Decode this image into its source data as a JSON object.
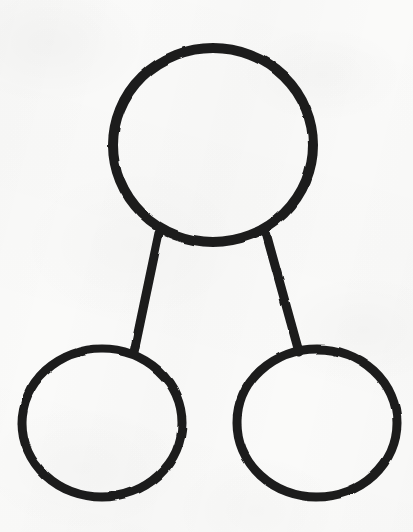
{
  "document": {
    "kind": "hand-drawn-scanned-diagram",
    "title": "Three-circle connected node diagram",
    "width": 413,
    "height": 532,
    "background_color": "#fafaf9",
    "ink_color": "#1c1c1c",
    "stroke_width": 9,
    "visible_text": ""
  },
  "diagram": {
    "type": "node-link",
    "node_count": 3,
    "edge_count": 2,
    "nodes": [
      {
        "id": "top-node",
        "label": "",
        "shape": "circle",
        "cx": 213,
        "cy": 145,
        "r": 95,
        "stroke_width": 10,
        "stroke": "#1c1c1c",
        "fill": "none",
        "role": "parent"
      },
      {
        "id": "bottom-left-node",
        "label": "",
        "shape": "circle",
        "cx": 102,
        "cy": 423,
        "r": 75,
        "stroke_width": 9,
        "stroke": "#1c1c1c",
        "fill": "none",
        "role": "child"
      },
      {
        "id": "bottom-right-node",
        "label": "",
        "shape": "circle",
        "cx": 317,
        "cy": 423,
        "r": 75,
        "stroke_width": 9,
        "stroke": "#1c1c1c",
        "fill": "none",
        "role": "child"
      }
    ],
    "edges": [
      {
        "id": "edge-top-to-bottom-left",
        "from": "top-node",
        "to": "bottom-left-node",
        "x1": 159,
        "y1": 233,
        "x2": 134,
        "y2": 352,
        "stroke_width": 9,
        "stroke": "#1c1c1c"
      },
      {
        "id": "edge-top-to-bottom-right",
        "from": "top-node",
        "to": "bottom-right-node",
        "x1": 266,
        "y1": 233,
        "x2": 299,
        "y2": 352,
        "stroke_width": 9,
        "stroke": "#1c1c1c"
      }
    ]
  }
}
